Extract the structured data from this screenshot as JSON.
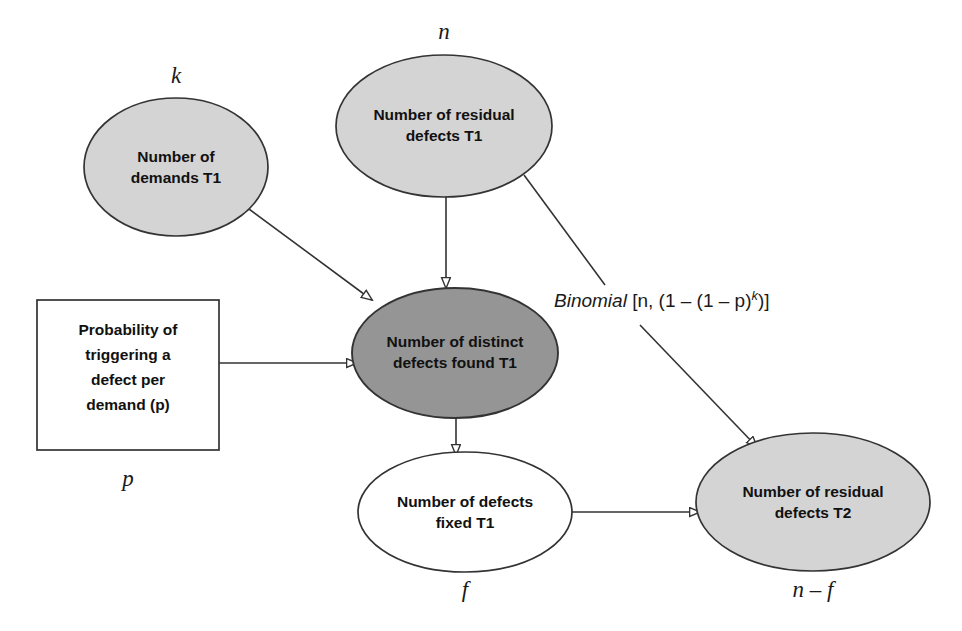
{
  "diagram": {
    "background_color": "#ffffff",
    "stroke_color": "#333333",
    "text_color": "#111111",
    "fill_light_gray": "#d4d4d4",
    "fill_dark_gray": "#959595",
    "fill_white": "#ffffff",
    "nodes": [
      {
        "id": "demands_t1",
        "shape": "ellipse",
        "fill": "#d4d4d4",
        "line1": "Number of",
        "line2": "demands T1",
        "variable": "k",
        "variable_position": "top"
      },
      {
        "id": "residual_t1",
        "shape": "ellipse",
        "fill": "#d4d4d4",
        "line1": "Number of residual",
        "line2": "defects T1",
        "variable": "n",
        "variable_position": "top"
      },
      {
        "id": "probability_box",
        "shape": "rectangle",
        "fill": "#ffffff",
        "line1": "Probability of",
        "line2": "triggering a",
        "line3": "defect per",
        "line4": "demand (p)",
        "variable": "p",
        "variable_position": "bottom"
      },
      {
        "id": "distinct_found_t1",
        "shape": "ellipse",
        "fill": "#959595",
        "line1": "Number of distinct",
        "line2": "defects found T1",
        "variable": "",
        "variable_position": "none"
      },
      {
        "id": "fixed_t1",
        "shape": "ellipse",
        "fill": "#ffffff",
        "line1": "Number of defects",
        "line2": "fixed T1",
        "variable": "f",
        "variable_position": "bottom"
      },
      {
        "id": "residual_t2",
        "shape": "ellipse",
        "fill": "#d4d4d4",
        "line1": "Number of residual",
        "line2": "defects T2",
        "variable": "n – f",
        "variable_position": "bottom"
      }
    ],
    "edges": [
      {
        "id": "edge-demands-to-distinct",
        "from": "demands_t1",
        "to": "distinct_found_t1",
        "arrowhead": "hollow-triangle"
      },
      {
        "id": "edge-residual-t1-to-distinct",
        "from": "residual_t1",
        "to": "distinct_found_t1",
        "arrowhead": "hollow-triangle"
      },
      {
        "id": "edge-probability-to-distinct",
        "from": "probability_box",
        "to": "distinct_found_t1",
        "arrowhead": "hollow-triangle"
      },
      {
        "id": "edge-residual-t1-to-residual-t2",
        "from": "residual_t1",
        "to": "residual_t2",
        "arrowhead": "hollow-triangle"
      },
      {
        "id": "edge-distinct-to-fixed",
        "from": "distinct_found_t1",
        "to": "fixed_t1",
        "arrowhead": "hollow-triangle"
      },
      {
        "id": "edge-fixed-to-residual-t2",
        "from": "fixed_t1",
        "to": "residual_t2",
        "arrowhead": "hollow-triangle"
      }
    ],
    "annotation": {
      "id": "binomial-formula",
      "name_part": "Binomial",
      "expression_part": " [n, (1 – (1 – p)",
      "exponent": "k",
      "tail_part": ")]"
    }
  }
}
